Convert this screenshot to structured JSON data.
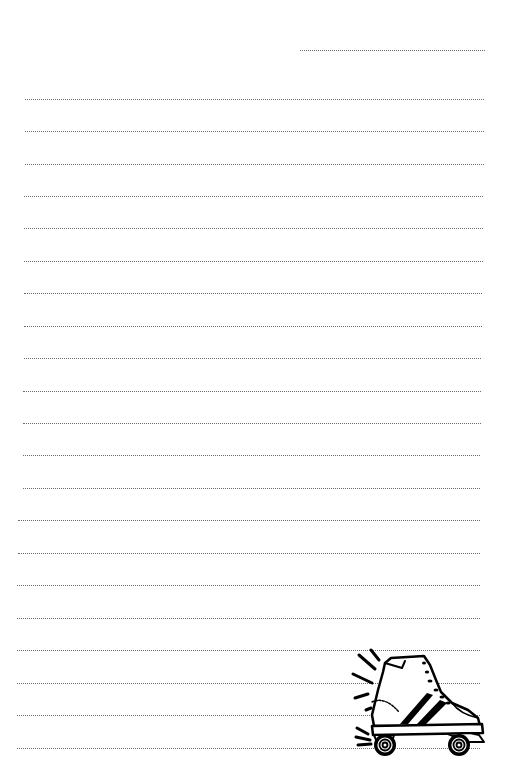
{
  "page": {
    "type": "lined-notepaper",
    "background": "#ffffff",
    "rule_color": "#6a6a6a",
    "header_line": {
      "x1": 300,
      "x2": 485,
      "y": 50
    },
    "lines": [
      {
        "x1": 25,
        "x2": 484,
        "y": 99
      },
      {
        "x1": 25,
        "x2": 484,
        "y": 131
      },
      {
        "x1": 25,
        "x2": 484,
        "y": 164
      },
      {
        "x1": 24,
        "x2": 483,
        "y": 196
      },
      {
        "x1": 24,
        "x2": 483,
        "y": 228
      },
      {
        "x1": 24,
        "x2": 483,
        "y": 261
      },
      {
        "x1": 24,
        "x2": 482,
        "y": 293
      },
      {
        "x1": 24,
        "x2": 482,
        "y": 326
      },
      {
        "x1": 24,
        "x2": 481,
        "y": 358
      },
      {
        "x1": 23,
        "x2": 481,
        "y": 391
      },
      {
        "x1": 23,
        "x2": 481,
        "y": 423
      },
      {
        "x1": 23,
        "x2": 480,
        "y": 455
      },
      {
        "x1": 23,
        "x2": 480,
        "y": 488
      },
      {
        "x1": 18,
        "x2": 480,
        "y": 520
      },
      {
        "x1": 18,
        "x2": 480,
        "y": 553
      },
      {
        "x1": 17,
        "x2": 480,
        "y": 585
      },
      {
        "x1": 17,
        "x2": 480,
        "y": 618
      },
      {
        "x1": 17,
        "x2": 480,
        "y": 650
      },
      {
        "x1": 17,
        "x2": 480,
        "y": 683
      },
      {
        "x1": 17,
        "x2": 480,
        "y": 715
      },
      {
        "x1": 17,
        "x2": 480,
        "y": 748
      }
    ],
    "illustration": {
      "name": "roller-skate",
      "stroke": "#000000"
    }
  }
}
